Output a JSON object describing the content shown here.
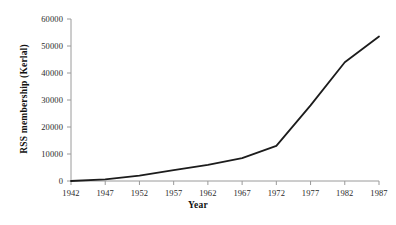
{
  "chart_data": {
    "type": "line",
    "title": "",
    "xlabel": "Year",
    "ylabel": "RSS membership (Kerlal)",
    "x": [
      1942,
      1947,
      1952,
      1957,
      1962,
      1967,
      1972,
      1977,
      1982,
      1987
    ],
    "values": [
      0,
      600,
      2000,
      4000,
      6000,
      8500,
      13000,
      28000,
      44000,
      53500
    ],
    "series": [
      {
        "name": "RSS membership (Kerala)",
        "values": [
          0,
          600,
          2000,
          4000,
          6000,
          8500,
          13000,
          28000,
          44000,
          53500
        ]
      }
    ],
    "categories": [
      "1942",
      "1947",
      "1952",
      "1957",
      "1962",
      "1967",
      "1972",
      "1977",
      "1982",
      "1987"
    ],
    "x_tick_labels": [
      "1942",
      "1947",
      "1952",
      "1957",
      "1962",
      "1967",
      "1972",
      "1977",
      "1982",
      "1987"
    ],
    "y_tick_labels": [
      "0",
      "10000",
      "20000",
      "30000",
      "40000",
      "50000",
      "60000"
    ],
    "y_ticks": [
      0,
      10000,
      20000,
      30000,
      40000,
      50000,
      60000
    ],
    "xlim": [
      1942,
      1987
    ],
    "ylim": [
      0,
      60000
    ],
    "grid": false,
    "legend": false,
    "legend_position": "none",
    "line_color": "#1c1c1c",
    "line_width": 1.8,
    "axis_color": "#9a9a9a",
    "background_color": "#ffffff"
  }
}
